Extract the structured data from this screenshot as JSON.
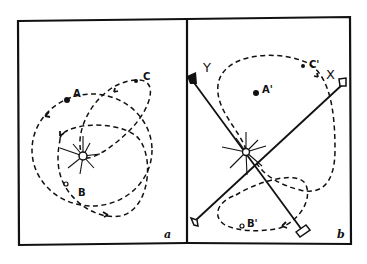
{
  "figure": {
    "panels": [
      {
        "id": "a",
        "label": "a",
        "points": [
          {
            "name": "A",
            "label": "A"
          },
          {
            "name": "B",
            "label": "B"
          },
          {
            "name": "C",
            "label": "C"
          }
        ],
        "center": "sun"
      },
      {
        "id": "b",
        "label": "b",
        "points": [
          {
            "name": "A'",
            "label": "A'"
          },
          {
            "name": "B'",
            "label": "B'"
          },
          {
            "name": "C'",
            "label": "C'"
          }
        ],
        "axes": [
          {
            "name": "X",
            "label": "X"
          },
          {
            "name": "Y",
            "label": "Y"
          }
        ],
        "center": "sun"
      }
    ]
  }
}
